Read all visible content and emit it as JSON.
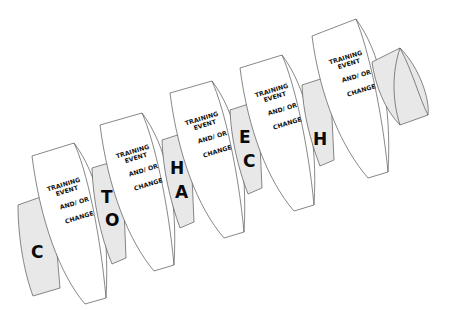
{
  "diagram": {
    "title": "",
    "colors": {
      "background": "#ffffff",
      "disk_fill": "#ffffff",
      "connector_fill": "#e8e8e8",
      "outline": "#555555",
      "text": "#111111"
    },
    "disks": [
      {
        "line1": "TRAINING",
        "line2": "EVENT",
        "line3": "AND/ OR",
        "line4": "CHANGE"
      },
      {
        "line1": "TRAINING",
        "line2": "EVENT",
        "line3": "AND/ OR",
        "line4": "CHANGE"
      },
      {
        "line1": "TRAINING",
        "line2": "EVENT",
        "line3": "AND/ OR",
        "line4": "CHANGE"
      },
      {
        "line1": "TRAINING",
        "line2": "EVENT",
        "line3": "AND/ OR",
        "line4": "CHANGE"
      },
      {
        "line1": "TRAINING",
        "line2": "EVENT",
        "line3": "AND/ OR",
        "line4": "CHANGE"
      }
    ],
    "connectors": [
      {
        "top": "",
        "bottom": "C"
      },
      {
        "top": "T",
        "bottom": "O"
      },
      {
        "top": "H",
        "bottom": "A"
      },
      {
        "top": "E",
        "bottom": "C"
      },
      {
        "top": "",
        "bottom": "H"
      },
      {
        "top": "",
        "bottom": ""
      }
    ]
  }
}
